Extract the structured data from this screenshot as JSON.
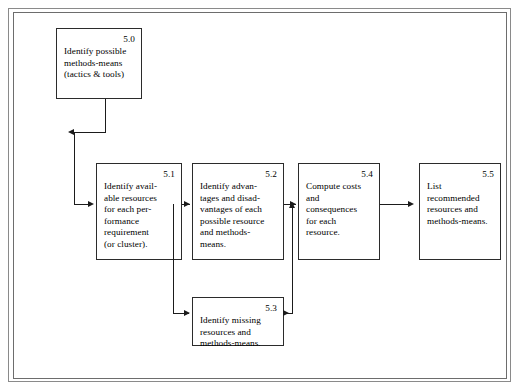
{
  "diagram": {
    "frame": {
      "style": "double-rule-border"
    },
    "ink_color": "#1b1b1b",
    "paper_color": "#ffffff",
    "nodes": [
      {
        "id": "5.0",
        "number": "5.0",
        "text": "Identify possible\nmethods-means\n(tactics & tools)"
      },
      {
        "id": "5.1",
        "number": "5.1",
        "text": "Identify avail-\nable resources\nfor each per-\nformance\nrequirement\n(or cluster)."
      },
      {
        "id": "5.2",
        "number": "5.2",
        "text": "Identify advan-\ntages and disad-\nvantages of each\npossible resource\nand methods-\nmeans."
      },
      {
        "id": "5.3",
        "number": "5.3",
        "text": "Identify missing\nresources and\nmethods-means."
      },
      {
        "id": "5.4",
        "number": "5.4",
        "text": "Compute costs\nand\nconsequences\nfor each\nresource."
      },
      {
        "id": "5.5",
        "number": "5.5",
        "text": "List\nrecommended\nresources and\nmethods-means."
      }
    ],
    "edges": [
      {
        "from": "5.0",
        "to": "5.1",
        "routing": "down-left-down-right"
      },
      {
        "from": "5.1",
        "to": "5.2",
        "routing": "right"
      },
      {
        "from": "5.1",
        "to": "5.3",
        "routing": "down-right"
      },
      {
        "from": "5.2",
        "to": "5.4",
        "routing": "right"
      },
      {
        "from": "5.3",
        "to": "5.4",
        "routing": "right-up"
      },
      {
        "from": "5.4",
        "to": "5.5",
        "routing": "right"
      }
    ]
  }
}
